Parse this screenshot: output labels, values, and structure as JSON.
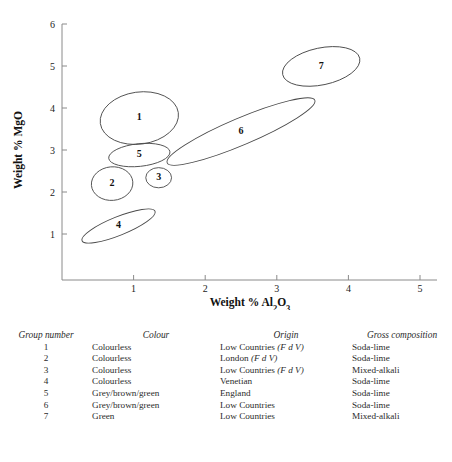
{
  "chart_data": {
    "type": "scatter",
    "title": "",
    "xlabel": "Weight % Al2O3",
    "xlabel_parts": {
      "prefix": "Weight % Al",
      "sub1": "2",
      "mid": "O",
      "sub2": "3"
    },
    "ylabel": "Weight % MgO",
    "xlim": [
      0,
      5
    ],
    "ylim": [
      0,
      6
    ],
    "xticks": [
      1,
      2,
      3,
      4,
      5
    ],
    "yticks": [
      1,
      2,
      3,
      4,
      5,
      6
    ],
    "grid": false,
    "legend": "none",
    "ellipses": [
      {
        "label": "1",
        "cx": 1.08,
        "cy": 3.76,
        "rx": 0.55,
        "ry": 0.62,
        "rot": -8
      },
      {
        "label": "2",
        "cx": 0.7,
        "cy": 2.2,
        "rx": 0.29,
        "ry": 0.4,
        "rot": -5
      },
      {
        "label": "3",
        "cx": 1.35,
        "cy": 2.34,
        "rx": 0.18,
        "ry": 0.24,
        "rot": 0
      },
      {
        "label": "4",
        "cx": 0.79,
        "cy": 1.19,
        "rx": 0.55,
        "ry": 0.22,
        "rot": -22
      },
      {
        "label": "5",
        "cx": 1.08,
        "cy": 2.88,
        "rx": 0.43,
        "ry": 0.27,
        "rot": -6
      },
      {
        "label": "6",
        "cx": 2.5,
        "cy": 3.44,
        "rx": 1.12,
        "ry": 0.32,
        "rot": -23
      },
      {
        "label": "7",
        "cx": 3.62,
        "cy": 4.99,
        "rx": 0.55,
        "ry": 0.44,
        "rot": -12
      }
    ]
  },
  "table": {
    "headers": [
      "Group number",
      "Colour",
      "Origin",
      "Gross composition"
    ],
    "rows": [
      {
        "group": "1",
        "colour": "Colourless",
        "origin_main": "Low Countries",
        "origin_note": "(F d V)",
        "gross": "Soda-lime"
      },
      {
        "group": "2",
        "colour": "Colourless",
        "origin_main": "London",
        "origin_note": "(F d V)",
        "gross": "Soda-lime"
      },
      {
        "group": "3",
        "colour": "Colourless",
        "origin_main": "Low Countries",
        "origin_note": "(F d V)",
        "gross": "Mixed-alkali"
      },
      {
        "group": "4",
        "colour": "Colourless",
        "origin_main": "Venetian",
        "origin_note": "",
        "gross": "Soda-lime"
      },
      {
        "group": "5",
        "colour": "Grey/brown/green",
        "origin_main": "England",
        "origin_note": "",
        "gross": "Soda-lime"
      },
      {
        "group": "6",
        "colour": "Grey/brown/green",
        "origin_main": "Low Countries",
        "origin_note": "",
        "gross": "Soda-lime"
      },
      {
        "group": "7",
        "colour": "Green",
        "origin_main": "Low Countries",
        "origin_note": "",
        "gross": "Mixed-alkali"
      }
    ]
  },
  "caption": {
    "text": ""
  }
}
